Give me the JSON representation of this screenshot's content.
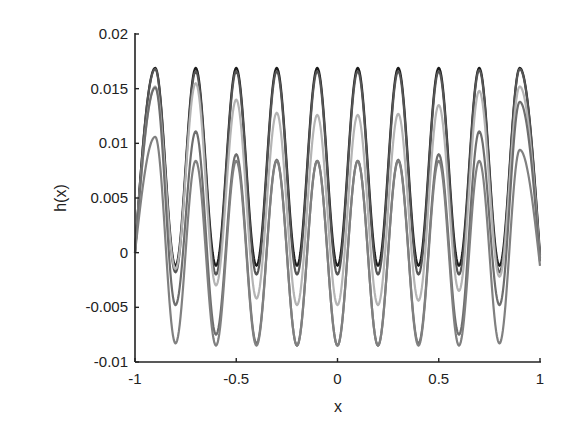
{
  "chart_data": {
    "type": "line",
    "title": "",
    "xlabel": "x",
    "ylabel": "h(x)",
    "xlim": [
      -1,
      1
    ],
    "ylim": [
      -0.01,
      0.02
    ],
    "xticks": [
      -1,
      -0.5,
      0,
      0.5,
      1
    ],
    "xtick_labels": [
      "-1",
      "-0.5",
      "0",
      "0.5",
      "1"
    ],
    "yticks": [
      -0.01,
      -0.005,
      0,
      0.005,
      0.01,
      0.015,
      0.02
    ],
    "ytick_labels": [
      "-0.01",
      "-0.005",
      "0",
      "0.005",
      "0.01",
      "0.015",
      "0.02"
    ],
    "grid": false,
    "legend": null,
    "box": false,
    "extrema_x": [
      -1,
      -0.9,
      -0.8,
      -0.7,
      -0.6,
      -0.5,
      -0.4,
      -0.3,
      -0.2,
      -0.1,
      0,
      0.1,
      0.2,
      0.3,
      0.4,
      0.5,
      0.6,
      0.7,
      0.8,
      0.9,
      1
    ],
    "series": [
      {
        "name": "curve-1",
        "color": "#1a1a1a",
        "values": [
          0,
          0.0169,
          -0.0012,
          0.0169,
          -0.0012,
          0.0169,
          -0.0012,
          0.0169,
          -0.0012,
          0.0169,
          -0.0012,
          0.0169,
          -0.0012,
          0.0169,
          -0.0012,
          0.0169,
          -0.0012,
          0.0169,
          -0.0012,
          0.0169,
          -0.0002
        ]
      },
      {
        "name": "curve-2",
        "color": "#555555",
        "values": [
          0,
          0.0168,
          -0.0018,
          0.0166,
          -0.002,
          0.0166,
          -0.002,
          0.0166,
          -0.002,
          0.0166,
          -0.002,
          0.0166,
          -0.002,
          0.0166,
          -0.002,
          0.0166,
          -0.002,
          0.0167,
          -0.0018,
          0.0168,
          -0.0005
        ]
      },
      {
        "name": "curve-3",
        "color": "#b4b4b4",
        "values": [
          0,
          0.0152,
          -0.0015,
          0.0155,
          -0.003,
          0.014,
          -0.0042,
          0.0128,
          -0.0048,
          0.0126,
          -0.0048,
          0.0126,
          -0.0048,
          0.0127,
          -0.0044,
          0.0135,
          -0.0035,
          0.0148,
          -0.0022,
          0.0152,
          -0.0008
        ]
      },
      {
        "name": "curve-4",
        "color": "#6e6e6e",
        "values": [
          0,
          0.0151,
          -0.0048,
          0.0111,
          -0.0075,
          0.009,
          -0.0083,
          0.0085,
          -0.0085,
          0.0084,
          -0.0085,
          0.0084,
          -0.0085,
          0.0085,
          -0.0083,
          0.009,
          -0.0075,
          0.0111,
          -0.0048,
          0.0138,
          -0.0008
        ]
      },
      {
        "name": "curve-5",
        "color": "#808080",
        "values": [
          0,
          0.0106,
          -0.0083,
          0.0084,
          -0.0085,
          0.0084,
          -0.0085,
          0.0084,
          -0.0085,
          0.0084,
          -0.0085,
          0.0084,
          -0.0085,
          0.0084,
          -0.0085,
          0.0084,
          -0.0085,
          0.0084,
          -0.0083,
          0.0094,
          -0.0012
        ]
      }
    ]
  }
}
